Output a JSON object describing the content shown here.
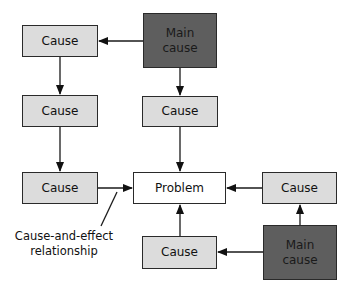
{
  "diagram": {
    "type": "cause-and-effect flow",
    "nodes": {
      "cause_left_1": "Cause",
      "cause_left_2": "Cause",
      "cause_left_3": "Cause",
      "main_cause_top": "Main\ncause",
      "cause_center_top": "Cause",
      "problem": "Problem",
      "cause_right": "Cause",
      "cause_bottom": "Cause",
      "main_cause_bottom": "Main\ncause"
    },
    "annotation": {
      "line1": "Cause-and-effect",
      "line2": "relationship"
    },
    "edges": [
      {
        "from": "main_cause_top",
        "to": "cause_left_1"
      },
      {
        "from": "main_cause_top",
        "to": "cause_center_top"
      },
      {
        "from": "cause_left_1",
        "to": "cause_left_2"
      },
      {
        "from": "cause_left_2",
        "to": "cause_left_3"
      },
      {
        "from": "cause_left_3",
        "to": "problem"
      },
      {
        "from": "cause_center_top",
        "to": "problem"
      },
      {
        "from": "cause_right",
        "to": "problem"
      },
      {
        "from": "cause_bottom",
        "to": "problem"
      },
      {
        "from": "main_cause_bottom",
        "to": "cause_right"
      },
      {
        "from": "main_cause_bottom",
        "to": "cause_bottom"
      }
    ],
    "colors": {
      "cause_fill": "#dcdcdc",
      "main_cause_fill": "#5e5e5e",
      "problem_fill": "#ffffff",
      "stroke": "#2a2a2a"
    }
  }
}
